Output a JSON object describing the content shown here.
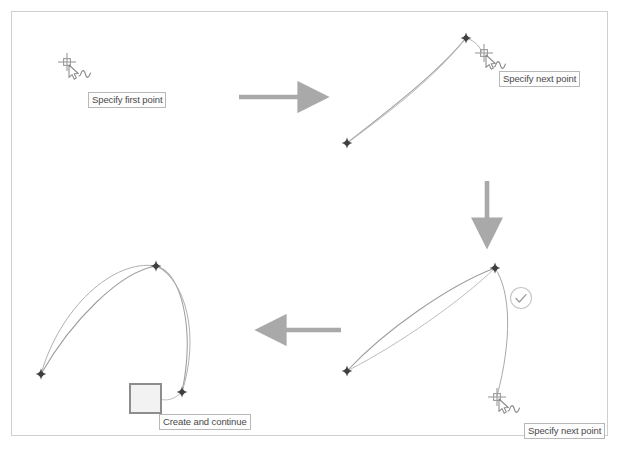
{
  "diagram": {
    "border_color": "#cfcfcf",
    "background": "#ffffff",
    "curve_color": "#9a9a9a",
    "node_color": "#4d4d4d",
    "arrow_color": "#a9a9a9",
    "cursor_color": "#8a8a8a"
  },
  "tooltips": {
    "specify_first_point": "Specify first point",
    "specify_next_point_1": "Specify next point",
    "specify_next_point_2": "Specify next point",
    "create_and_continue": "Create and continue"
  },
  "steps": [
    {
      "id": "step-1",
      "name": "pick-first-point",
      "label": "Specify first point",
      "cursor": "crosshair-with-pointer",
      "nodes": 0
    },
    {
      "id": "step-2",
      "name": "pick-second-point",
      "label": "Specify next point",
      "cursor": "crosshair-with-pointer",
      "nodes": 2
    },
    {
      "id": "step-3",
      "name": "pick-third-point",
      "label": "Specify next point",
      "cursor": "crosshair-with-pointer",
      "badge": "check-circle",
      "nodes": 2
    },
    {
      "id": "step-4",
      "name": "create-and-continue",
      "label": "Create and continue",
      "cursor": "hand-pointer",
      "nodes": 3
    }
  ],
  "arrows": [
    {
      "name": "arrow-step1-to-step2",
      "direction": "right"
    },
    {
      "name": "arrow-step2-to-step3",
      "direction": "down"
    },
    {
      "name": "arrow-step3-to-step4",
      "direction": "left"
    }
  ],
  "footer": {
    "clipped_text": ""
  }
}
